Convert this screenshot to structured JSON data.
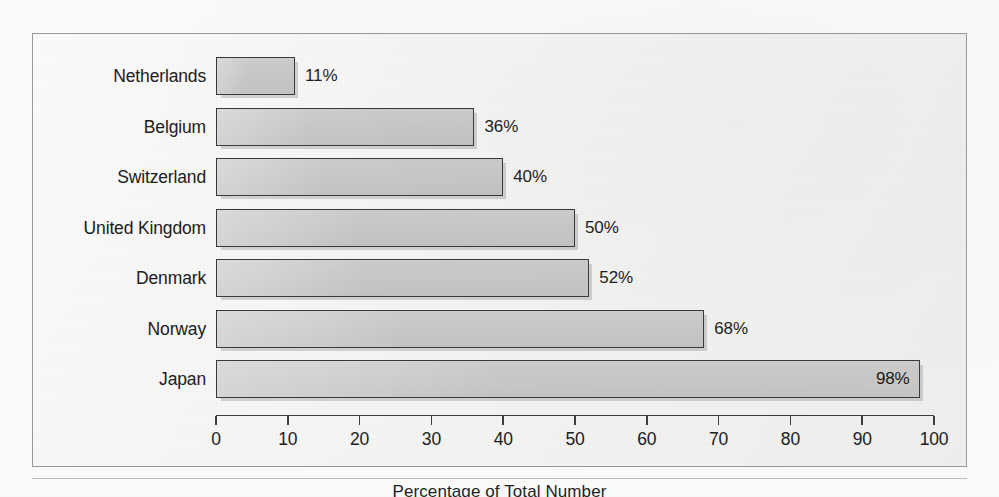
{
  "chart_data": {
    "type": "bar",
    "orientation": "horizontal",
    "title": "",
    "xlabel": "Percentage of Total Number",
    "ylabel": "",
    "categories": [
      "Netherlands",
      "Belgium",
      "Switzerland",
      "United Kingdom",
      "Denmark",
      "Norway",
      "Japan"
    ],
    "values": [
      11,
      36,
      40,
      50,
      52,
      68,
      98
    ],
    "value_labels": [
      "11%",
      "36%",
      "40%",
      "50%",
      "52%",
      "68%",
      "98%"
    ],
    "label_inside_bar": [
      false,
      false,
      false,
      false,
      false,
      false,
      true
    ],
    "xlim": [
      0,
      100
    ],
    "xticks": [
      0,
      10,
      20,
      30,
      40,
      50,
      60,
      70,
      80,
      90,
      100
    ],
    "xtick_labels": [
      "0",
      "10",
      "20",
      "30",
      "40",
      "50",
      "60",
      "70",
      "80",
      "90",
      "100"
    ],
    "grid": false,
    "legend": false,
    "legend_position": "none",
    "bar_fill_color": "#c9c9c7",
    "bar_border_color": "#3a3a3c",
    "plot_background_color": "#f6f6f4",
    "frame_border_color": "#9a9a9c",
    "text_color": "#1d1d1f"
  },
  "caption": {
    "text": "Percentage of Total Number"
  },
  "bleed_text": {
    "line1": "the interior of the structure remains",
    "line2": "under review by the committee",
    "line3": "as noted in the preceding chapter",
    "line4": "were largely complete by that time",
    "line5": "and the remaining survey returns",
    "line6": "indicate a comparable distribution"
  }
}
